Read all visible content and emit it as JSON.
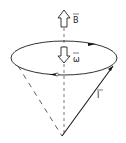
{
  "diagram": {
    "labels": {
      "field": "B",
      "angular_velocity": "ω",
      "angular_momentum": "I"
    },
    "colors": {
      "stroke": "#1a1a1a",
      "dash": "#555555",
      "background": "#ffffff"
    }
  }
}
